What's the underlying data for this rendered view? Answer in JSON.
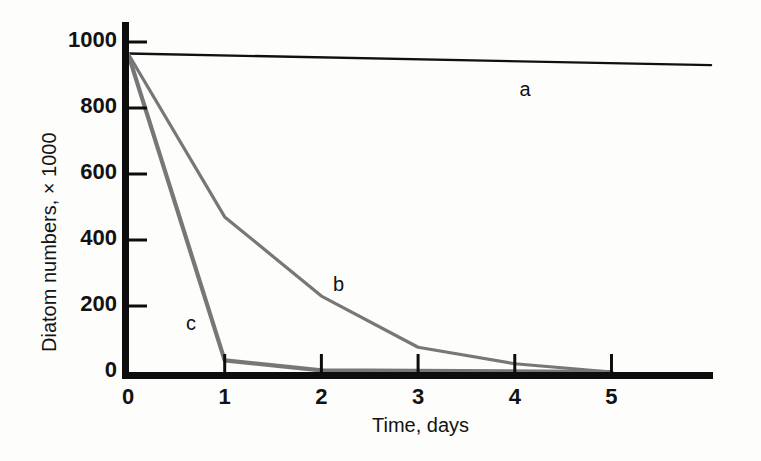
{
  "chart_data": {
    "type": "line",
    "title": "",
    "xlabel": "Time, days",
    "ylabel": "Diatom numbers, × 1000",
    "xlim": [
      0,
      6.05
    ],
    "ylim": [
      0,
      1080
    ],
    "xticks": [
      0,
      1,
      2,
      3,
      4,
      5
    ],
    "xtick_labels": [
      "0",
      "1",
      "2",
      "3",
      "4",
      "5"
    ],
    "yticks": [
      0,
      200,
      400,
      600,
      800,
      1000
    ],
    "ytick_labels": [
      "0",
      "200",
      "400",
      "600",
      "800",
      "1000"
    ],
    "grid": false,
    "legend": "inline-labels",
    "series": [
      {
        "name": "a",
        "label": "a",
        "color": "#101010",
        "linewidth": 2.4,
        "label_position": {
          "x": 4.05,
          "y": 855
        },
        "x": [
          0,
          6.03
        ],
        "y": [
          965,
          930
        ]
      },
      {
        "name": "b",
        "label": "b",
        "color": "#777777",
        "linewidth": 3.2,
        "label_position": {
          "x": 2.12,
          "y": 265
        },
        "x": [
          0,
          1,
          2,
          3,
          4,
          5
        ],
        "y": [
          965,
          470,
          230,
          75,
          25,
          0
        ]
      },
      {
        "name": "c",
        "label": "c",
        "color": "#777777",
        "linewidth": 4.2,
        "label_position": {
          "x": 0.6,
          "y": 145
        },
        "x": [
          0,
          1,
          2,
          5
        ],
        "y": [
          965,
          35,
          5,
          0
        ]
      }
    ]
  },
  "axes": {
    "spine_color": "#0d0d0d",
    "y_spine_width": 7,
    "x_spine_width": 7,
    "tick_color": "#0d0d0d"
  }
}
